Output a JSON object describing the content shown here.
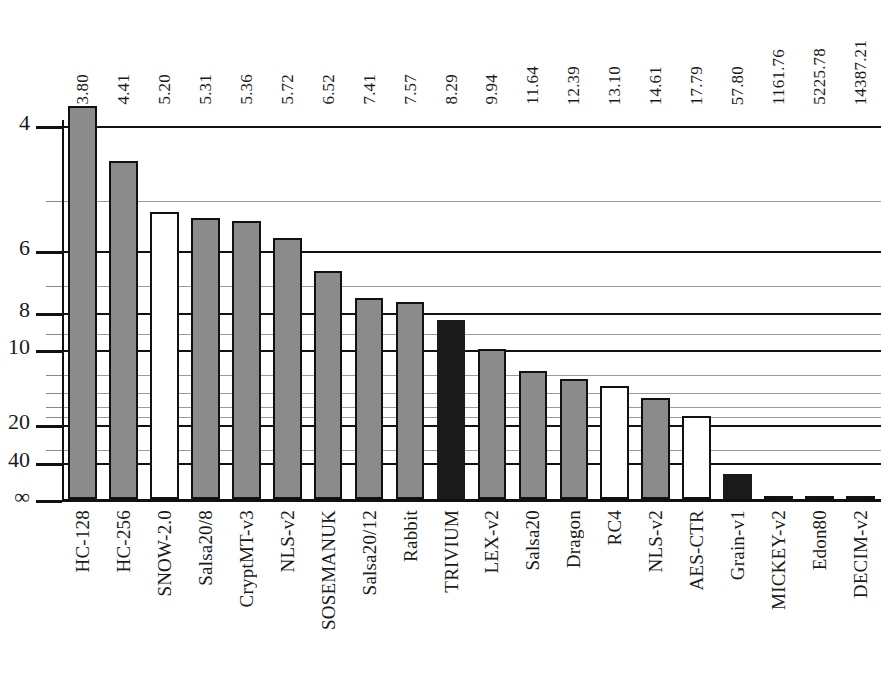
{
  "chart_data": {
    "type": "bar",
    "title": "",
    "subtitle": "",
    "xlabel": "",
    "ylabel": "",
    "categories": [
      "HC-128",
      "HC-256",
      "SNOW-2.0",
      "Salsa20/8",
      "CryptMT-v3",
      "NLS-v2",
      "SOSEMANUK",
      "Salsa20/12",
      "Rabbit",
      "TRIVIUM",
      "LEX-v2",
      "Salsa20",
      "Dragon",
      "RC4",
      "NLS-v2",
      "AES-CTR",
      "Grain-v1",
      "MICKEY-v2",
      "Edon80",
      "DECIM-v2"
    ],
    "values": [
      3.8,
      4.41,
      5.2,
      5.31,
      5.36,
      5.72,
      6.52,
      7.41,
      7.57,
      8.29,
      9.94,
      11.64,
      12.39,
      13.1,
      14.61,
      17.79,
      57.8,
      1161.76,
      5225.78,
      14387.21
    ],
    "value_labels": [
      "3.80",
      "4.41",
      "5.20",
      "5.31",
      "5.36",
      "5.72",
      "6.52",
      "7.41",
      "7.57",
      "8.29",
      "9.94",
      "11.64",
      "12.39",
      "13.10",
      "14.61",
      "17.79",
      "57.80",
      "1161.76",
      "5225.78",
      "14387.21"
    ],
    "bar_styles": [
      "gray",
      "gray",
      "white",
      "gray",
      "gray",
      "gray",
      "gray",
      "gray",
      "gray",
      "black",
      "gray",
      "gray",
      "gray",
      "white",
      "gray",
      "white",
      "black",
      "gray",
      "gray",
      "gray"
    ],
    "yticks": [
      {
        "label": "4",
        "value": 4,
        "major": true
      },
      {
        "label": "",
        "value": 5,
        "major": false
      },
      {
        "label": "6",
        "value": 6,
        "major": true
      },
      {
        "label": "",
        "value": 7,
        "major": false
      },
      {
        "label": "8",
        "value": 8,
        "major": true
      },
      {
        "label": "",
        "value": 9,
        "major": false
      },
      {
        "label": "10",
        "value": 10,
        "major": true
      },
      {
        "label": "",
        "value": 12,
        "major": false
      },
      {
        "label": "",
        "value": 14,
        "major": false
      },
      {
        "label": "",
        "value": 16,
        "major": false
      },
      {
        "label": "",
        "value": 18,
        "major": false
      },
      {
        "label": "20",
        "value": 20,
        "major": true
      },
      {
        "label": "",
        "value": 30,
        "major": false
      },
      {
        "label": "40",
        "value": 40,
        "major": true
      },
      {
        "label": "∞",
        "value": 0,
        "major": true
      }
    ],
    "yaxis_scale": "inverse (reciprocal) — smaller value plots higher",
    "ylim_labels": [
      "4",
      "∞"
    ],
    "grid": true,
    "legend": null,
    "legend_position": "none",
    "colors": {
      "bar_gray": "#8b8b8b",
      "bar_white": "#ffffff",
      "bar_black": "#1a1a1a",
      "gridline_major": "#111111",
      "gridline_minor": "#9a9a9a",
      "background": "#ffffff",
      "text": "#1a1a1a"
    }
  }
}
